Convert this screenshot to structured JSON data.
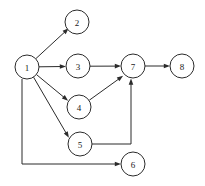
{
  "figure": {
    "width": 205,
    "height": 186,
    "background_color": "#ffffff",
    "stroke_color": "#2b2b2b",
    "label_color": "#1a1a1a",
    "node_fill_color": "#ffffff",
    "node_radius": 12
  },
  "chart_data": {
    "type": "diagram",
    "subtype": "directed-graph",
    "directed": true,
    "node_radius": 12,
    "nodes": [
      {
        "id": "1",
        "label": "1",
        "cx": 27,
        "cy": 67
      },
      {
        "id": "2",
        "label": "2",
        "cx": 77,
        "cy": 22
      },
      {
        "id": "3",
        "label": "3",
        "cx": 78,
        "cy": 66
      },
      {
        "id": "4",
        "label": "4",
        "cx": 79,
        "cy": 107
      },
      {
        "id": "5",
        "label": "5",
        "cx": 80,
        "cy": 144
      },
      {
        "id": "6",
        "label": "6",
        "cx": 133,
        "cy": 164
      },
      {
        "id": "7",
        "label": "7",
        "cx": 133,
        "cy": 66
      },
      {
        "id": "8",
        "label": "8",
        "cx": 182,
        "cy": 66
      }
    ],
    "edges": [
      {
        "from": "1",
        "to": "2",
        "style": "straight",
        "path": "M 36.0 58.5 L 66.8 30.1",
        "arrow_at": [
          68.7,
          28.3
        ],
        "arrow_angle": -42.6
      },
      {
        "from": "1",
        "to": "3",
        "style": "straight",
        "path": "M 39.0 66.8 L 63.5 66.5",
        "arrow_at": [
          66.0,
          66.4
        ],
        "arrow_angle": -0.6
      },
      {
        "from": "1",
        "to": "4",
        "style": "straight",
        "path": "M 36.4 74.5 L 66.2 99.1",
        "arrow_at": [
          68.1,
          100.7
        ],
        "arrow_angle": 39.5
      },
      {
        "from": "1",
        "to": "5",
        "style": "straight",
        "path": "M 33.5 77.1 L 67.6 135.6",
        "arrow_at": [
          68.9,
          137.8
        ],
        "arrow_angle": 59.8
      },
      {
        "from": "1",
        "to": "6",
        "style": "orthogonal",
        "path": "M 22.0 79.0 L 22.0 164.0 L 118.5 164.0",
        "arrow_at": [
          121.0,
          164.0
        ],
        "arrow_angle": 0
      },
      {
        "from": "3",
        "to": "7",
        "style": "straight",
        "path": "M 90.0 66.2 L 118.5 66.1",
        "arrow_at": [
          121.0,
          66.1
        ],
        "arrow_angle": -0.2
      },
      {
        "from": "4",
        "to": "7",
        "style": "straight",
        "path": "M 89.3 100.2 L 121.1 77.3",
        "arrow_at": [
          123.1,
          75.8
        ],
        "arrow_angle": -35.8
      },
      {
        "from": "5",
        "to": "7",
        "style": "orthogonal",
        "path": "M 92.0 144.0 L 131.0 144.0 L 131.0 81.0",
        "arrow_at": [
          131.0,
          78.5
        ],
        "arrow_angle": -90
      },
      {
        "from": "7",
        "to": "8",
        "style": "straight",
        "path": "M 145.0 66.0 L 167.5 66.0",
        "arrow_at": [
          170.0,
          66.0
        ],
        "arrow_angle": 0
      }
    ],
    "adjacency": {
      "1": [
        "2",
        "3",
        "4",
        "5",
        "6"
      ],
      "2": [],
      "3": [
        "7"
      ],
      "4": [
        "7"
      ],
      "5": [
        "7"
      ],
      "6": [],
      "7": [
        "8"
      ],
      "8": []
    },
    "node_count": 8,
    "edge_count": 9
  }
}
